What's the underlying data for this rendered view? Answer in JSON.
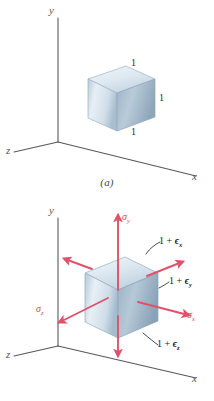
{
  "figure_a": {
    "caption": "(a)",
    "axes": {
      "y": "y",
      "x": "x",
      "z": "z"
    },
    "cube_dimensions": [
      {
        "id": "top-edge",
        "label": "1"
      },
      {
        "id": "right-edge",
        "label": "1"
      },
      {
        "id": "bottom-edge",
        "label": "1"
      }
    ]
  },
  "figure_b": {
    "caption": "(b)",
    "axes": {
      "y": "y",
      "x": "x",
      "z": "z"
    },
    "stresses": [
      {
        "id": "sigma-y",
        "symbol": "σ",
        "subscript": "y"
      },
      {
        "id": "sigma-x",
        "symbol": "σ",
        "subscript": "x"
      },
      {
        "id": "sigma-z",
        "symbol": "σ",
        "subscript": "z"
      }
    ],
    "strains": [
      {
        "id": "strain-x",
        "prefix": "1 + ",
        "symbol": "ϵ",
        "subscript": "x"
      },
      {
        "id": "strain-y",
        "prefix": "1 + ",
        "symbol": "ϵ",
        "subscript": "y"
      },
      {
        "id": "strain-z",
        "prefix": "1 + ",
        "symbol": "ϵ",
        "subscript": "z"
      }
    ]
  },
  "colors": {
    "axis": "#55585c",
    "arrow": "#e2516a",
    "stress_text": "#d94a5a",
    "cube_light": "#eef3f7",
    "cube_mid": "#c4d4e0",
    "cube_dark": "#9fb4c6",
    "leader": "#1c1c1c",
    "background": "#ffffff"
  }
}
